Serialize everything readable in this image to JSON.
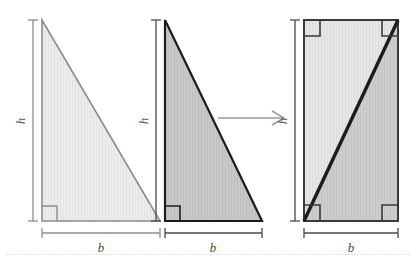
{
  "figure": {
    "background_color": "#ffffff",
    "labels": {
      "base": "b",
      "height": "h"
    },
    "panels": [
      {
        "id": "panel-1",
        "name": "light-triangle",
        "shape": "right-triangle",
        "base_label": "b",
        "height_label": "h",
        "fill_color": "#ececec",
        "stroke_color": "#8c8c8c",
        "stroke_width": 1.6,
        "right_angle_corner": "bottom-left",
        "geometry": {
          "apex_x": 42,
          "apex_y": 20,
          "bottom_left_x": 42,
          "bottom_left_y": 221,
          "bottom_right_x": 160,
          "bottom_right_y": 221
        }
      },
      {
        "id": "panel-2",
        "name": "dark-triangle",
        "shape": "right-triangle",
        "base_label": "b",
        "height_label": "h",
        "fill_color": "#c6c6c6",
        "stroke_color": "#1c1c1c",
        "stroke_width": 2.2,
        "right_angle_corner": "bottom-left",
        "geometry": {
          "apex_x": 165,
          "apex_y": 20,
          "bottom_left_x": 165,
          "bottom_left_y": 221,
          "bottom_right_x": 262,
          "bottom_right_y": 221
        }
      },
      {
        "id": "panel-3",
        "name": "combined-rectangle",
        "shape": "rectangle-with-diagonal",
        "base_label": "b",
        "height_label": "h",
        "fill_color_upper": "#e4e4e4",
        "fill_color_lower": "#cacaca",
        "stroke_color": "#3a3a3a",
        "stroke_width": 2.0,
        "diagonal_color": "#1c1c1c",
        "diagonal_width": 3.4,
        "diagonal_from": "bottom-left",
        "diagonal_to": "top-right",
        "right_angle_corners": [
          "top-left",
          "top-right",
          "bottom-left",
          "bottom-right"
        ],
        "geometry": {
          "left_x": 304,
          "right_x": 398,
          "top_y": 20,
          "bottom_y": 221
        }
      }
    ],
    "arrow": {
      "name": "transform-arrow",
      "direction": "right",
      "color": "#9a9a9a",
      "x1": 218,
      "x2": 284,
      "y": 118
    },
    "baseline_rule": {
      "name": "page-baseline",
      "color": "#d8d8d8",
      "style": "dotted",
      "y": 254
    }
  }
}
